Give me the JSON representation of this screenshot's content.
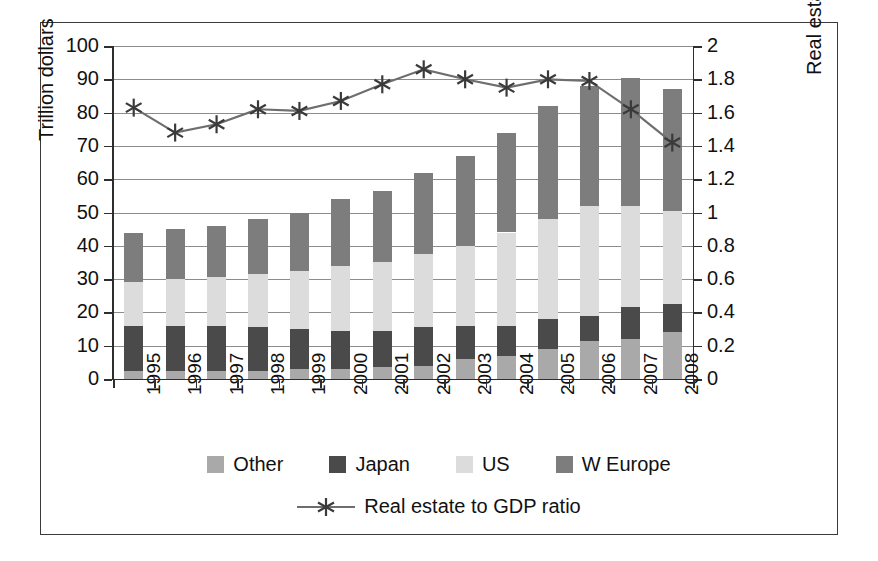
{
  "chart_data": {
    "type": "bar",
    "title": "",
    "subtitle": "",
    "xlabel": "",
    "ylabel": "Trillion dollars",
    "y2label": "Real estate to GDP ratio",
    "categories": [
      "1995",
      "1996",
      "1997",
      "1998",
      "1999",
      "2000",
      "2001",
      "2002",
      "2003",
      "2004",
      "2005",
      "2006",
      "2007",
      "2008"
    ],
    "ylim": [
      0,
      100
    ],
    "yticks": [
      "0",
      "10",
      "20",
      "30",
      "40",
      "50",
      "60",
      "70",
      "80",
      "90",
      "100"
    ],
    "y2lim": [
      0,
      2
    ],
    "y2ticks": [
      "0",
      "0.2",
      "0.4",
      "0.6",
      "0.8",
      "1",
      "1.2",
      "1.4",
      "1.6",
      "1.8",
      "2"
    ],
    "grid": true,
    "legend_position": "bottom",
    "stacked": true,
    "series": [
      {
        "name": "Other",
        "axis": "left",
        "color": "#a9a9a9",
        "values": [
          2.5,
          2.5,
          2.5,
          2.5,
          3.0,
          3.0,
          3.5,
          4.0,
          6.0,
          7.0,
          9.0,
          11.5,
          12.0,
          14.0
        ]
      },
      {
        "name": "Japan",
        "axis": "left",
        "color": "#4a4a4a",
        "values": [
          13.5,
          13.5,
          13.5,
          13.0,
          12.0,
          11.5,
          11.0,
          11.5,
          10.0,
          9.0,
          9.0,
          7.5,
          9.5,
          8.5
        ]
      },
      {
        "name": "US",
        "axis": "left",
        "color": "#dcdcdc",
        "values": [
          13.0,
          14.0,
          14.5,
          16.0,
          17.5,
          19.5,
          20.5,
          22.0,
          24.0,
          28.0,
          30.0,
          33.0,
          30.5,
          28.0
        ]
      },
      {
        "name": "W Europe",
        "axis": "left",
        "color": "#7d7d7d",
        "values": [
          15.0,
          15.0,
          15.5,
          16.5,
          17.5,
          20.0,
          21.5,
          24.5,
          27.0,
          30.0,
          34.0,
          36.0,
          38.5,
          36.5
        ]
      }
    ],
    "line_series": {
      "name": "Real estate to GDP ratio",
      "axis": "right",
      "color": "#6e6e6e",
      "marker": "asterisk",
      "values": [
        1.63,
        1.48,
        1.53,
        1.62,
        1.61,
        1.67,
        1.77,
        1.86,
        1.8,
        1.75,
        1.8,
        1.79,
        1.62,
        1.42
      ]
    }
  },
  "legend": {
    "row1": [
      {
        "label": "Other",
        "color": "#a9a9a9"
      },
      {
        "label": "Japan",
        "color": "#4a4a4a"
      },
      {
        "label": "US",
        "color": "#dcdcdc"
      },
      {
        "label": "W Europe",
        "color": "#7d7d7d"
      }
    ],
    "row2_label": "Real estate to GDP ratio"
  }
}
